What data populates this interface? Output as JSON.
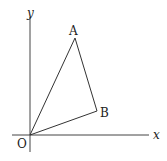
{
  "diagram": {
    "type": "coordinate-triangle",
    "axes": {
      "x_label": "x",
      "y_label": "y",
      "origin_label": "O"
    },
    "points": {
      "O": {
        "label": "O"
      },
      "A": {
        "label": "A"
      },
      "B": {
        "label": "B"
      }
    },
    "segments": [
      "OA",
      "AB",
      "OB"
    ],
    "colors": {
      "stroke": "#333333",
      "background": "#ffffff"
    }
  }
}
